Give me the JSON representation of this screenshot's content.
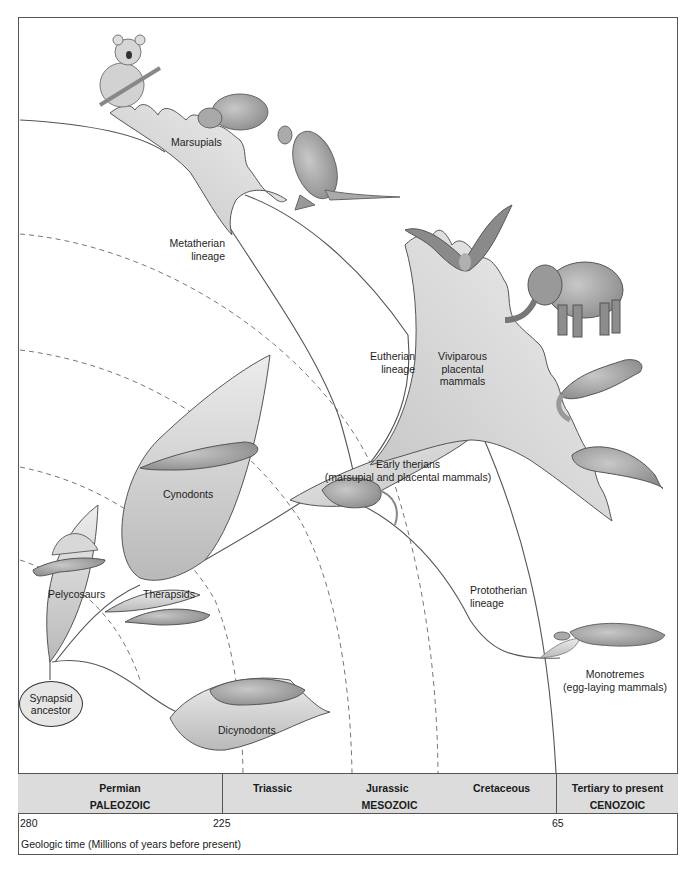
{
  "diagram": {
    "ancestor": {
      "label_line1": "Synapsid",
      "label_line2": "ancestor"
    },
    "groups": [
      {
        "id": "pelycosaurs",
        "label": "Pelycosaurs"
      },
      {
        "id": "therapsids",
        "label": "Therapsids"
      },
      {
        "id": "cynodonts",
        "label": "Cynodonts"
      },
      {
        "id": "dicynodonts",
        "label": "Dicynodonts"
      },
      {
        "id": "early-therians",
        "label_line1": "Early therians",
        "label_line2": "(marsupial and placental mammals)"
      },
      {
        "id": "marsupials",
        "label": "Marsupials"
      },
      {
        "id": "placentals",
        "label_line1": "Viviparous",
        "label_line2": "placental",
        "label_line3": "mammals"
      },
      {
        "id": "monotremes",
        "label_line1": "Monotremes",
        "label_line2": "(egg-laying mammals)"
      }
    ],
    "lineages": [
      {
        "id": "metatherian",
        "label_line1": "Metatherian",
        "label_line2": "lineage"
      },
      {
        "id": "eutherian",
        "label_line1": "Eutherian",
        "label_line2": "lineage"
      },
      {
        "id": "prototherian",
        "label_line1": "Prototherian",
        "label_line2": "lineage"
      }
    ],
    "animals": [
      "koala",
      "wombat",
      "kangaroo",
      "bat",
      "elephant",
      "ferret",
      "manatee",
      "platypus",
      "early-therian-shrew",
      "cynodont",
      "dimetrodon",
      "therapsid",
      "dicynodont"
    ]
  },
  "timescale": {
    "periods": [
      {
        "name": "Permian",
        "era": "PALEOZOIC"
      },
      {
        "name": "Triassic"
      },
      {
        "name": "Jurassic",
        "era": "MESOZOIC"
      },
      {
        "name": "Cretaceous"
      },
      {
        "name": "Tertiary to present",
        "era": "CENOZOIC"
      }
    ],
    "ticks": [
      "280",
      "225",
      "65"
    ],
    "axis_title": "Geologic time (Millions of years before present)"
  },
  "colors": {
    "frame": "#555555",
    "band": "#dcdcdc",
    "fill_light": "#e8e8e8",
    "fill_dark": "#b5b5b5",
    "line": "#555555"
  }
}
